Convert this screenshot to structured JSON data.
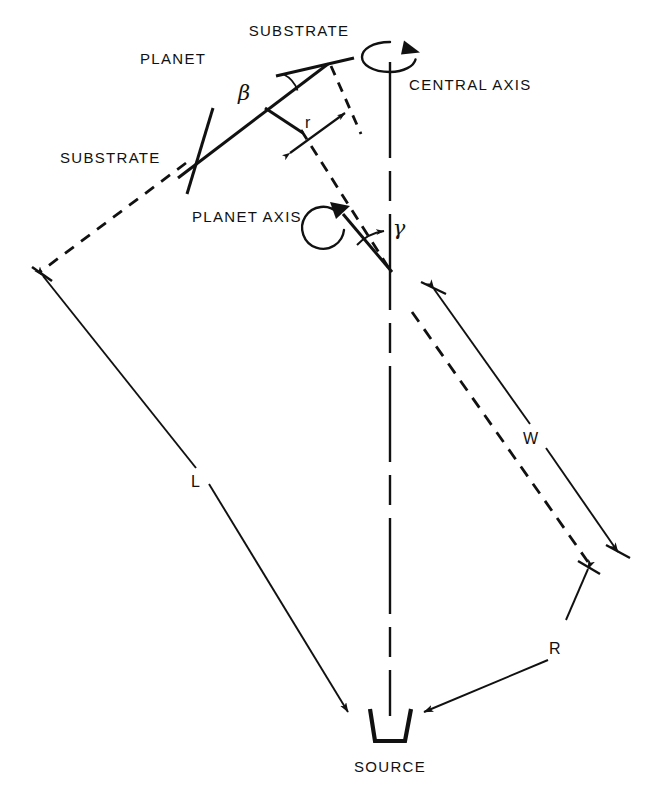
{
  "figure": {
    "background": "#ffffff",
    "ink": "#111111"
  },
  "labels": {
    "substrate_top": "SUBSTRATE",
    "substrate_left": "SUBSTRATE",
    "planet": "PLANET",
    "planet_axis": "PLANET AXIS",
    "central_axis": "CENTRAL AXIS",
    "source": "SOURCE"
  },
  "dimensions": {
    "r": "r",
    "L": "L",
    "W": "W",
    "R": "R"
  },
  "angles": {
    "beta": "β",
    "gamma": "γ"
  },
  "icons": {
    "central_rotation": "rotation-arrow-icon",
    "planet_rotation": "rotation-arrow-icon",
    "source_crucible": "crucible-icon"
  }
}
